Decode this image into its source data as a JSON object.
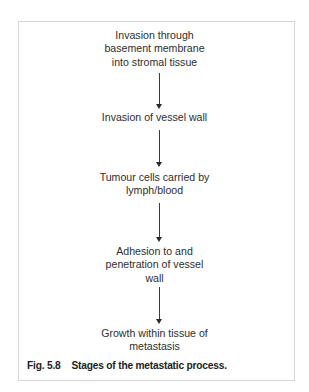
{
  "figure": {
    "steps": [
      {
        "lines": [
          "Invasion through",
          "basement membrane",
          "into stromal tissue"
        ]
      },
      {
        "lines": [
          "Invasion of vessel wall"
        ]
      },
      {
        "lines": [
          "Tumour cells carried by",
          "lymph/blood"
        ]
      },
      {
        "lines": [
          "Adhesion to and",
          "penetration of vessel",
          "wall"
        ]
      },
      {
        "lines": [
          "Growth within tissue of",
          "metastasis"
        ]
      }
    ],
    "arrows": [
      "down-arrow",
      "down-arrow",
      "down-arrow",
      "down-arrow"
    ],
    "caption": {
      "number": "Fig. 5.8",
      "text": "Stages of the metastatic process."
    }
  }
}
